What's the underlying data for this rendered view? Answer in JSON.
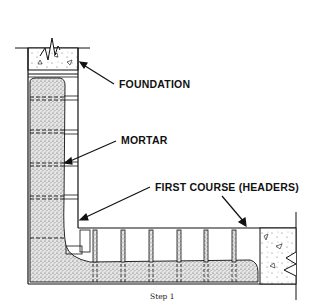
{
  "diagram": {
    "labels": {
      "foundation": "FOUNDATION",
      "mortar": "MORTAR",
      "first_course": "FIRST COURSE (HEADERS)"
    },
    "caption": "Step 1",
    "colors": {
      "line": "#111111",
      "stipple_fill": "#d9d9d9",
      "background": "#ffffff"
    },
    "parts": [
      {
        "name": "foundation",
        "description": "Concrete foundation cap at top of vertical wall"
      },
      {
        "name": "mortar",
        "description": "Stippled mortar bed along the vertical wall"
      },
      {
        "name": "first-course-headers",
        "description": "Row of header bricks along horizontal base"
      },
      {
        "name": "concrete-end-block",
        "description": "Concrete block with break line at right end"
      }
    ]
  }
}
